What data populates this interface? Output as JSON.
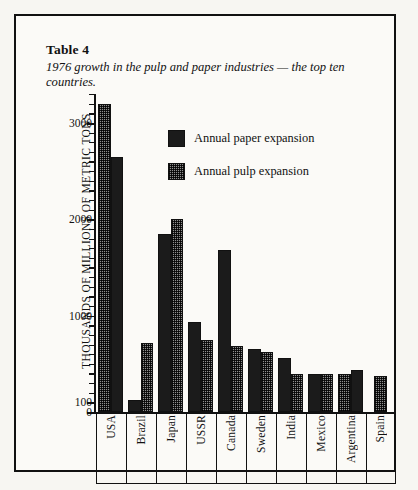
{
  "table": {
    "title": "Table 4",
    "caption": "1976 growth in the pulp and paper industries — the top ten countries."
  },
  "legend": {
    "paper_label": "Annual paper expansion",
    "pulp_label": "Annual pulp expansion",
    "paper_color": "#1b1b1b",
    "pulp_color": "#8f8f8f"
  },
  "chart_data": {
    "type": "bar",
    "title": "1976 growth in the pulp and paper industries — the top ten countries.",
    "xlabel": "",
    "ylabel": "THOUSANDS OF MILLIONS OF METRIC TONS",
    "ylim": [
      0,
      3300
    ],
    "ytick_labels": [
      "3000",
      "2000",
      "1000",
      "100",
      "0"
    ],
    "ytick_values": [
      3000,
      2000,
      1000,
      100,
      0
    ],
    "minor_tick_step": 100,
    "grid": false,
    "legend_position": "upper-center",
    "categories": [
      "USA",
      "Brazil",
      "Japan",
      "USSR",
      "Canada",
      "Sweden",
      "India",
      "Mexico",
      "Argentina",
      "Spain"
    ],
    "series": [
      {
        "name": "Annual paper expansion",
        "values": [
          2650,
          120,
          1850,
          930,
          1680,
          650,
          560,
          390,
          440,
          null
        ]
      },
      {
        "name": "Annual pulp expansion",
        "values": [
          3200,
          720,
          2000,
          750,
          690,
          620,
          390,
          390,
          390,
          370
        ]
      }
    ],
    "bar_order_per_group": [
      [
        "pulp",
        "paper"
      ],
      [
        "paper",
        "pulp"
      ],
      [
        "paper",
        "pulp"
      ],
      [
        "paper",
        "pulp"
      ],
      [
        "paper",
        "pulp"
      ],
      [
        "paper",
        "pulp"
      ],
      [
        "paper",
        "pulp"
      ],
      [
        "paper",
        "pulp"
      ],
      [
        "pulp",
        "paper"
      ],
      [
        "pulp"
      ]
    ]
  }
}
